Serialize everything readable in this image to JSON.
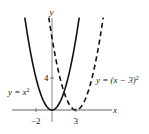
{
  "chart_data": {
    "type": "line",
    "title": "",
    "xlabel": "x",
    "ylabel": "y",
    "x_ticks": [
      {
        "value": -2,
        "label": "−2"
      },
      {
        "value": 3,
        "label": "3"
      }
    ],
    "y_ticks": [
      {
        "value": 4,
        "label": "4"
      }
    ],
    "xlim": [
      -6.5,
      8
    ],
    "ylim": [
      -3,
      11.5
    ],
    "grid": false,
    "legend": "none (curves labeled inline)",
    "series": [
      {
        "name": "y = x^2",
        "label_text": "y = x",
        "label_sup": "2",
        "style": "solid",
        "formula": "x^2",
        "x": [
          -3.4,
          -3,
          -2,
          -1,
          0,
          1,
          2,
          3,
          3.4
        ],
        "y": [
          11.56,
          9,
          4,
          1,
          0,
          1,
          4,
          9,
          11.56
        ]
      },
      {
        "name": "y = (x - 3)^2",
        "label_text": "y = (x − 3)",
        "label_sup": "2",
        "style": "dashed",
        "formula": "(x-3)^2",
        "x": [
          -0.4,
          0,
          1,
          2,
          3,
          4,
          5,
          6,
          6.4
        ],
        "y": [
          11.56,
          9,
          4,
          1,
          0,
          1,
          4,
          9,
          11.56
        ]
      }
    ]
  },
  "axes": {
    "x_label": "x",
    "y_label": "y",
    "tick_neg2": "−2",
    "tick_3": "3",
    "tick_4": "4"
  },
  "labels": {
    "parabola": "y = x",
    "parabola_sup": "2",
    "shifted": "y = (x − 3)",
    "shifted_sup": "2"
  },
  "colors": {
    "curve": "#111111",
    "axis": "#555555"
  }
}
